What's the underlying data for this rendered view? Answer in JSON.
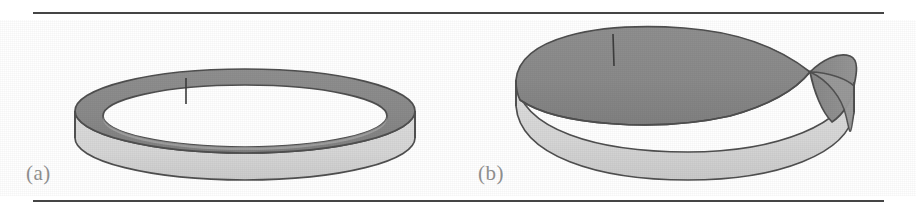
{
  "figure": {
    "caption_labels": {
      "a": "(a)",
      "b": "(b)"
    },
    "panels": [
      {
        "id": "a",
        "label": "(a)",
        "object_name": "cylindrical band (annulus)",
        "description": "untwisted band / cylinder seen in oblique perspective, showing dark inner-top surface and light outer wall",
        "seam_visible": true
      },
      {
        "id": "b",
        "label": "(b)",
        "object_name": "Mobius strip",
        "description": "band with a half twist, the twist crossing near the right side, showing dark surface passing over to light surface",
        "seam_visible": true
      }
    ]
  },
  "colors": {
    "background": "#ffffff",
    "rule": "#2b2b2b",
    "surface_dark": "#8a8a8a",
    "surface_light": "#d8d8d8",
    "outline": "#4f4f4f",
    "label_text": "#8d8d8d"
  },
  "layout": {
    "width": 916,
    "height": 210,
    "rule_top_y": 12,
    "rule_bottom_y": 200,
    "rule_left_x": 33,
    "rule_width": 851
  }
}
